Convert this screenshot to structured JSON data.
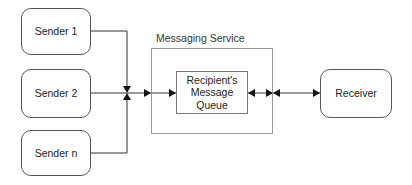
{
  "diagram": {
    "senders": [
      {
        "label": "Sender 1"
      },
      {
        "label": "Sender 2"
      },
      {
        "label": "Sender n"
      }
    ],
    "service": {
      "label": "Messaging Service",
      "queue": {
        "line1": "Recipient's",
        "line2": "Message",
        "line3": "Queue"
      }
    },
    "receiver": {
      "label": "Receiver"
    },
    "edges": [
      {
        "from": "Sender 1",
        "to": "junction"
      },
      {
        "from": "Sender 2",
        "to": "junction"
      },
      {
        "from": "Sender n",
        "to": "junction"
      },
      {
        "from": "junction",
        "to": "Messaging Service"
      },
      {
        "from": "Messaging Service",
        "to": "Recipient's Message Queue"
      },
      {
        "from": "Recipient's Message Queue",
        "to": "Messaging Service",
        "bidirectional": true
      },
      {
        "from": "Messaging Service",
        "to": "Receiver",
        "bidirectional": true
      }
    ],
    "colors": {
      "line": "#333333",
      "box_border": "#555555",
      "service_border": "#999999"
    }
  }
}
